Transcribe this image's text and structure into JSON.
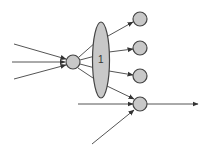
{
  "diagram": {
    "title": "",
    "colors": {
      "node_fill": "#c8c8c8",
      "node_stroke": "#444444",
      "edge": "#555555",
      "background": "#ffffff"
    },
    "group": {
      "label": "1",
      "shape": "ellipse",
      "cx": 101,
      "cy": 60,
      "rx": 8.5,
      "ry": 38
    },
    "nodes": [
      {
        "id": "source",
        "cx": 73,
        "cy": 62,
        "r": 7
      },
      {
        "id": "out1",
        "cx": 140,
        "cy": 19,
        "r": 7
      },
      {
        "id": "out2",
        "cx": 140,
        "cy": 48,
        "r": 7
      },
      {
        "id": "out3",
        "cx": 140,
        "cy": 76,
        "r": 7
      },
      {
        "id": "out4",
        "cx": 140,
        "cy": 104,
        "r": 7
      }
    ],
    "edges": [
      {
        "id": "in-top",
        "from": [
          14,
          44
        ],
        "to": [
          66,
          59
        ],
        "arrow": true
      },
      {
        "id": "in-mid",
        "from": [
          12,
          62
        ],
        "to": [
          65,
          62
        ],
        "arrow": true
      },
      {
        "id": "in-bottom",
        "from": [
          14,
          79
        ],
        "to": [
          66,
          65
        ],
        "arrow": true
      },
      {
        "id": "src-e1",
        "from": [
          79,
          57
        ],
        "to": [
          96,
          42
        ],
        "arrow": false
      },
      {
        "id": "src-e2",
        "from": [
          80,
          60
        ],
        "to": [
          95,
          56
        ],
        "arrow": false
      },
      {
        "id": "src-e3",
        "from": [
          80,
          64
        ],
        "to": [
          95,
          68
        ],
        "arrow": false
      },
      {
        "id": "src-e4",
        "from": [
          78,
          68
        ],
        "to": [
          96,
          80
        ],
        "arrow": false
      },
      {
        "id": "grp-out1",
        "from": [
          108,
          36
        ],
        "to": [
          133,
          22
        ],
        "arrow": true
      },
      {
        "id": "grp-out2",
        "from": [
          109,
          52
        ],
        "to": [
          133,
          49
        ],
        "arrow": true
      },
      {
        "id": "grp-out3",
        "from": [
          109,
          71
        ],
        "to": [
          133,
          75
        ],
        "arrow": true
      },
      {
        "id": "grp-out4",
        "from": [
          107,
          86
        ],
        "to": [
          134,
          99
        ],
        "arrow": true
      },
      {
        "id": "in-out4-h",
        "from": [
          78,
          104
        ],
        "to": [
          133,
          104
        ],
        "arrow": true
      },
      {
        "id": "in-out4-d",
        "from": [
          92,
          144
        ],
        "to": [
          134,
          110
        ],
        "arrow": true
      },
      {
        "id": "out4-output",
        "from": [
          147,
          104
        ],
        "to": [
          198,
          104
        ],
        "arrow": true
      }
    ]
  }
}
